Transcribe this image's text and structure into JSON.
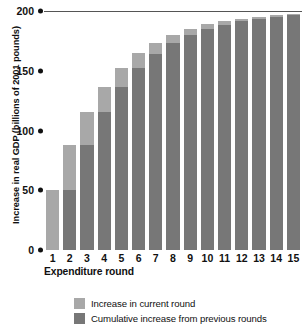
{
  "chart_data": {
    "type": "bar",
    "subtype": "stacked",
    "title": "",
    "xlabel": "Expenditure round",
    "ylabel": "Increase in real GDP (billions of 2001 pounds)",
    "categories": [
      "1",
      "2",
      "3",
      "4",
      "5",
      "6",
      "7",
      "8",
      "9",
      "10",
      "11",
      "12",
      "13",
      "14",
      "15"
    ],
    "series": [
      {
        "name": "Cumulative increase from previous rounds",
        "color": "#777777",
        "values": [
          0,
          50,
          87.5,
          115.6,
          136.7,
          152.6,
          164.4,
          173.3,
          180.0,
          185.0,
          188.7,
          191.5,
          193.7,
          195.3,
          196.5
        ]
      },
      {
        "name": "Increase in current round",
        "color": "#a8a8a8",
        "values": [
          50,
          37.5,
          28.1,
          21.1,
          15.8,
          11.9,
          8.9,
          6.7,
          5.0,
          3.8,
          2.8,
          2.1,
          1.6,
          1.2,
          0.9
        ]
      }
    ],
    "totals": [
      50,
      87.5,
      115.6,
      136.7,
      152.6,
      164.4,
      173.3,
      180.0,
      185.0,
      188.7,
      191.5,
      193.7,
      195.3,
      196.5,
      197.4
    ],
    "ylim": [
      0,
      200
    ],
    "yticks": [
      0,
      50,
      100,
      150,
      200
    ],
    "ytick_labels": [
      "0",
      "50",
      "100",
      "150",
      "200"
    ],
    "xlim_note": "15 discrete expenditure rounds",
    "grid": "top gridline only at 200",
    "legend_position": "bottom-left",
    "legend": [
      {
        "label": "Increase in current round",
        "color": "#a8a8a8"
      },
      {
        "label": "Cumulative increase from previous rounds",
        "color": "#777777"
      }
    ]
  },
  "colors": {
    "light_gray": "#a8a8a8",
    "dark_gray": "#777777",
    "axis": "#111111",
    "gridline": "#555555",
    "background": "#ffffff"
  }
}
